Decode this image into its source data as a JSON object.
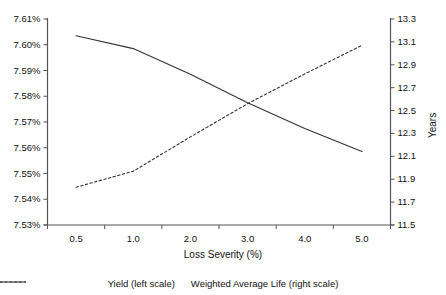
{
  "chart_data": {
    "type": "line",
    "title": "",
    "subtitle": "",
    "xlabel": "Loss Severity (%)",
    "ylabel": "",
    "categories": [
      "0.5",
      "1.0",
      "2.0",
      "3.0",
      "4.0",
      "5.0"
    ],
    "x": [
      0.5,
      1.0,
      2.0,
      3.0,
      4.0,
      5.0
    ],
    "grid": false,
    "legend_position": "bottom",
    "axes": {
      "left": {
        "label": "",
        "ylim": [
          7.53,
          7.61
        ],
        "tick_step": 0.01,
        "tick_labels": [
          "7.53%",
          "7.54%",
          "7.55%",
          "7.56%",
          "7.57%",
          "7.58%",
          "7.59%",
          "7.60%",
          "7.61%"
        ],
        "tick_values": [
          7.53,
          7.54,
          7.55,
          7.56,
          7.57,
          7.58,
          7.59,
          7.6,
          7.61
        ]
      },
      "right": {
        "label": "Years",
        "ylim": [
          11.5,
          13.3
        ],
        "tick_step": 0.2,
        "tick_labels": [
          "11.5",
          "11.7",
          "11.9",
          "12.1",
          "12.3",
          "12.5",
          "12.7",
          "12.9",
          "13.1",
          "13.3"
        ],
        "tick_values": [
          11.5,
          11.7,
          11.9,
          12.1,
          12.3,
          12.5,
          12.7,
          12.9,
          13.1,
          13.3
        ]
      },
      "x": {
        "label": "Loss Severity (%)",
        "tick_labels": [
          "0.5",
          "1.0",
          "2.0",
          "3.0",
          "4.0",
          "5.0"
        ]
      }
    },
    "series": [
      {
        "name": "Yield (left scale)",
        "axis": "left",
        "style": "solid",
        "color": "#333333",
        "values": [
          7.6035,
          7.5985,
          7.5885,
          7.5775,
          7.5675,
          7.5585
        ]
      },
      {
        "name": "Weighted Average Life (right scale)",
        "axis": "right",
        "style": "dashed",
        "color": "#333333",
        "values": [
          11.83,
          11.97,
          12.27,
          12.56,
          12.82,
          13.07
        ]
      }
    ],
    "legend": [
      {
        "label": "Yield (left scale)",
        "style": "solid"
      },
      {
        "label": "Weighted Average Life (right scale)",
        "style": "dashed"
      }
    ]
  }
}
